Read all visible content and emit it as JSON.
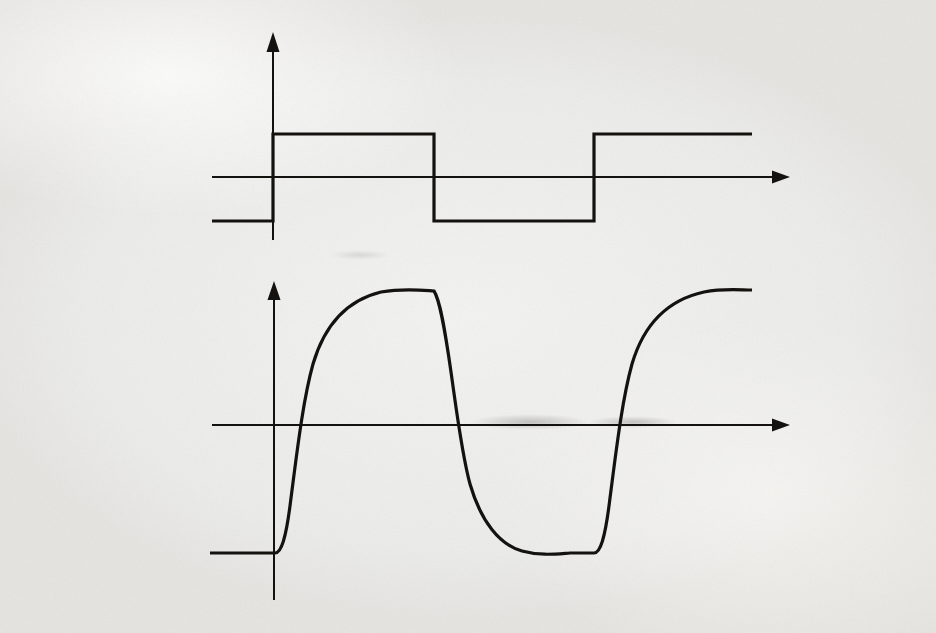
{
  "page": {
    "background_color": "#efefed",
    "ink_color": "#14120f",
    "bleed_color": "#b9b8b4",
    "caption": "(b)"
  },
  "labels": {
    "vi_axis": "v",
    "vi_sub": "i",
    "vo_axis": "v",
    "vo_sub": "o",
    "t_axis_top": "t",
    "t_axis_bottom": "t"
  },
  "chart_data": [
    {
      "type": "line",
      "title": "",
      "name": "input-square-wave",
      "xlabel": "t",
      "ylabel": "vi",
      "xlim": [
        212,
        790
      ],
      "ylim": [
        -1,
        1
      ],
      "grid": false,
      "legend": "none",
      "waveform": "square",
      "high_level": 1,
      "low_level": -1,
      "axis_x_px": 273,
      "axis_y_px": 177,
      "high_y_px": 134,
      "low_y_px": 221,
      "transitions_px": [
        212,
        273,
        434,
        594,
        752
      ],
      "points": [
        [
          212,
          221
        ],
        [
          273,
          221
        ],
        [
          273,
          134
        ],
        [
          434,
          134
        ],
        [
          434,
          221
        ],
        [
          594,
          221
        ],
        [
          594,
          134
        ],
        [
          752,
          134
        ]
      ]
    },
    {
      "type": "line",
      "title": "",
      "name": "output-rc-response",
      "xlabel": "t",
      "ylabel": "vo",
      "xlim": [
        212,
        790
      ],
      "ylim": [
        -1,
        1
      ],
      "grid": false,
      "legend": "none",
      "waveform": "exponential-charge-discharge",
      "peak_level": 1,
      "trough_level": -1,
      "axis_x_px": 274,
      "axis_y_px": 425,
      "peak_y_px": 290,
      "trough_y_px": 553,
      "transitions_px": [
        212,
        275,
        434,
        594,
        752
      ],
      "zero_crossings_px": [
        290,
        448,
        608
      ]
    }
  ],
  "bleed_text": {
    "lines": [
      {
        "t": "if the applied pulse is large enough to cause nonlinear operation of the circuit, the pulse",
        "x": 40,
        "y": 22,
        "s": 17
      },
      {
        "t": "response may differ significantly from that predicted here. This matter is discussed further",
        "x": 56,
        "y": 53,
        "s": 17
      },
      {
        "t": "in Chapter 9.",
        "x": 92,
        "y": 84,
        "s": 17
      },
      {
        "t": "PROBLEMS",
        "x": 56,
        "y": 150,
        "s": 21
      },
      {
        "t": "7.1 Use the Miller approximation to calcu-",
        "x": 56,
        "y": 196,
        "s": 15
      },
      {
        "t": "late the 3-dB frequency of the small-signal volt-",
        "x": 40,
        "y": 222,
        "s": 15
      },
      {
        "t": "age amplifier of Fig. 7.3 for the following",
        "x": 40,
        "y": 248,
        "s": 15
      },
      {
        "t": "parameters:",
        "x": 40,
        "y": 274,
        "s": 15
      },
      {
        "t": "= 300 Ω, Rs = 5 kΩ, RL = 5 kΩ,",
        "x": 78,
        "y": 300,
        "s": 15
      },
      {
        "t": "gm = 0.5 mA/V, Cgs = 7 pF, Cgd = 0.5 pF",
        "x": 62,
        "y": 326,
        "s": 15
      },
      {
        "t": "(b) Calculate the high-dominant-pole magni-",
        "x": 40,
        "y": 352,
        "s": 15
      },
      {
        "t": "tude for the circuit in (a). Compare your answer",
        "x": 40,
        "y": 378,
        "s": 15
      },
      {
        "t": "with a SPICE simulation.",
        "x": 40,
        "y": 404,
        "s": 15
      },
      {
        "t": "7.2 Repeat Problem 7.1 for the MOS transis-",
        "x": 40,
        "y": 430,
        "s": 15
      },
      {
        "t": "tor stage shown in Fig. 7.2 having R = 10 kΩ,",
        "x": 40,
        "y": 456,
        "s": 15
      },
      {
        "t": "gm = 0.5 mA/V, and the following",
        "x": 40,
        "y": 482,
        "s": 15
      },
      {
        "t": "capacitance values:",
        "x": 40,
        "y": 508,
        "s": 15
      },
      {
        "t": "7.4 Repeat Problem 7.3 for R = 0 and",
        "x": 478,
        "y": 196,
        "s": 15
      },
      {
        "t": "Cgd = 0.",
        "x": 520,
        "y": 222,
        "s": 15
      },
      {
        "t": "7.5 Repeat Problem 7.3 for the MOS circuit of",
        "x": 478,
        "y": 248,
        "s": 15
      },
      {
        "t": "Problem 7.2.",
        "x": 500,
        "y": 274,
        "s": 15
      },
      {
        "t": "7.6 A bipolar differential amplifier is shown",
        "x": 478,
        "y": 300,
        "s": 15
      },
      {
        "t": "in Fig. 7.8 has IEE = 1 mA. The resistor values",
        "x": 478,
        "y": 326,
        "s": 15
      },
      {
        "t": "are transistor data are as given in Problem 7.1.",
        "x": 478,
        "y": 352,
        "s": 15
      },
      {
        "t": "The collector load resistors have an associated",
        "x": 478,
        "y": 378,
        "s": 15
      },
      {
        "t": "shunt capacitance C = 2 pF.",
        "x": 478,
        "y": 404,
        "s": 15
      },
      {
        "t": "(a) Using the circuit of Fig. 7.10, calculate the",
        "x": 478,
        "y": 430,
        "s": 15
      },
      {
        "t": "gain and CMRR as a function of frequency. Sketch",
        "x": 478,
        "y": 456,
        "s": 15
      },
      {
        "t": "the magnitude of these quantities in decibels from",
        "x": 478,
        "y": 482,
        "s": 15
      },
      {
        "t": "10 kHz to 20 MHz using a log fre-",
        "x": 478,
        "y": 508,
        "s": 15
      },
      {
        "t": "quency scale. Compare your answer with a SPICE",
        "x": 478,
        "y": 534,
        "s": 15
      },
      {
        "t": "simulation.",
        "x": 478,
        "y": 560,
        "s": 15
      }
    ]
  }
}
